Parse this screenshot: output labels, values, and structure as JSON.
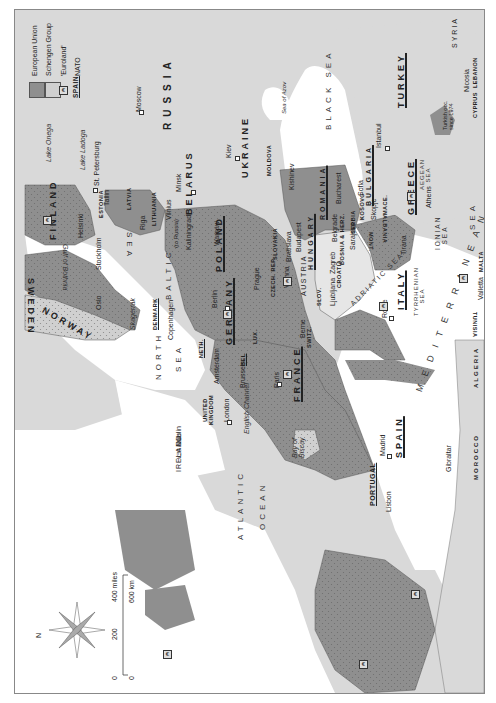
{
  "map": {
    "orientation": "rotated 90° — north points left",
    "legend": {
      "items": [
        {
          "swatch": "eu",
          "label": "European Union"
        },
        {
          "swatch": "schengen",
          "label": "Schengen Group"
        },
        {
          "swatch": "euro",
          "symbol": "€",
          "label": "'Euroland'"
        },
        {
          "swatch": "nato",
          "sample": "SPAIN",
          "label": "NATO"
        }
      ]
    },
    "colors": {
      "eu": "#8f8f8f",
      "non_eu_land": "#d9d9d9",
      "balkans_light": "#e6e6e6",
      "sea": "#ffffff",
      "border": "#555555"
    },
    "compass": {
      "label": "N"
    },
    "scale": {
      "miles_ticks": [
        "0",
        "200",
        "400 miles"
      ],
      "km_ticks": [
        "0",
        "600 km"
      ]
    },
    "countries": {
      "russia": "RUSSIA",
      "ukraine": "UKRAINE",
      "belarus": "BELARUS",
      "moldova": "MOLDOVA",
      "finland": "FINLAND",
      "sweden": "SWEDEN",
      "norway": "NORWAY",
      "estonia": "ESTONIA",
      "latvia": "LATVIA",
      "lithuania": "LITHUANIA",
      "poland": "POLAND",
      "germany": "GERMANY",
      "denmark": "DENMARK",
      "neth": "NETH.",
      "bel": "BEL",
      "lux": "LUX.",
      "france": "FRANCE",
      "uk": "UNITED KINGDOM",
      "ireland": "IRELAND",
      "spain": "SPAIN",
      "portugal": "PORTUGAL",
      "italy": "ITALY",
      "switz": "SWITZ.",
      "austria": "AUSTRIA",
      "czech": "CZECH. REP.",
      "slovakia": "SLOVAKIA",
      "hungary": "HUNGARY",
      "slov": "SLOV.",
      "croatia": "CROATIA",
      "bosnia": "BOSNIA & HERZ.",
      "serbia": "SERBIA",
      "kosovo": "KOSOVO",
      "mont": "MONT.",
      "albania": "ALBANIA",
      "mace": "MACE.",
      "romania": "ROMANIA",
      "bulgaria": "BULGARIA",
      "greece": "GREECE",
      "turkey": "TURKEY",
      "syria": "SYRIA",
      "lebanon": "LEBANON",
      "cyprus": "CYPRUS",
      "cyprus_note": "Turkish occ. since 1974",
      "malta": "MALTA",
      "tunisia": "TUNISIA",
      "algeria": "ALGERIA",
      "morocco": "MOROCCO"
    },
    "cities": {
      "moscow": "Moscow",
      "st_petersburg": "St. Petersburg",
      "kiev": "Kiev",
      "minsk": "Minsk",
      "kishinev": "Kishinev",
      "helsinki": "Helsinki",
      "tallin": "Tallin",
      "riga": "Riga",
      "vilnius": "Vilnius",
      "kaliningrad": "Kaliningrad",
      "kaliningrad_note": "(to Russia)",
      "stockholm": "Stockholm",
      "oslo": "Oslo",
      "copenhagen": "Copenhagen",
      "warsaw": "Warsaw",
      "berlin": "Berlin",
      "prague": "Prague",
      "vienna": "Vienna",
      "bratislava": "Bratislava",
      "budapest": "Budapest",
      "bucharest": "Bucharest",
      "sofia": "Sofia",
      "istanbul": "Istanbul",
      "belgrade": "Belgrade",
      "sarajevo": "Sarajevo",
      "skopje": "Skopje",
      "tirana": "Tirana",
      "zagreb": "Zagreb",
      "ljubljana": "Ljubljana",
      "athens": "Athens",
      "rome": "Rome",
      "valletta": "Valletta",
      "nicosia": "Nicosia",
      "berne": "Berne",
      "paris": "Paris",
      "brussels": "Brussels",
      "amsterdam": "Amsterdam",
      "london": "London",
      "dublin": "Dublin",
      "madrid": "Madrid",
      "lisbon": "Lisbon",
      "gibraltar": "Gibraltar"
    },
    "water": {
      "lake_onega": "Lake Onega",
      "lake_ladoga": "Lake Ladoga",
      "sea_of_azov": "Sea of Azov",
      "black_sea": "BLACK SEA",
      "baltic": "BALTIC",
      "baltic_sea": "SEA",
      "gulf_of_bothnia": "Gulf of Bothnia",
      "skagerrak": "Skagerrak",
      "north": "NORTH",
      "north_sea": "SEA",
      "irish_sea": "IRISH SEA",
      "english_channel": "English Channel",
      "bay_of_biscay": "Bay of Biscay",
      "atlantic": "ATLANTIC",
      "ocean": "OCEAN",
      "adriatic": "ADRIATIC SEA",
      "ionian": "IONIAN SEA",
      "tyrrhenian": "TYRRHENIAN SEA",
      "aegean": "AEGEAN SEA",
      "mediterranean": "MEDITERRANEAN",
      "med_sea": "SEA"
    }
  }
}
